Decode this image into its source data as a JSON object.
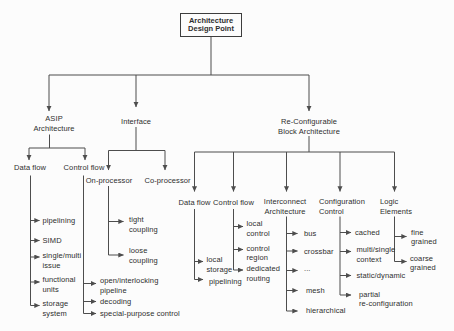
{
  "root": {
    "title": "Architecture\nDesign Point"
  },
  "nodes": {
    "asip": "ASIP\nArchitecture",
    "interface": "Interface",
    "reconfig": "Re-Configurable\nBlock Architecture",
    "asip_data_flow": "Data flow",
    "asip_control_flow": "Control flow",
    "on_processor": "On-processor",
    "co_processor": "Co-processor",
    "rc_data_flow": "Data flow",
    "rc_control_flow": "Control flow",
    "interconnect": "Interconnect\nArchitecture",
    "config_control": "Configuration\nControl",
    "logic_elements": "Logic\nElements"
  },
  "leaves": {
    "asip_data_flow": [
      "pipelining",
      "SIMD",
      "single/multi\nissue",
      "functional\nunits",
      "storage\nsystem"
    ],
    "asip_control_flow": [
      "open/interlocking\npipeline",
      "decoding",
      "special-purpose control"
    ],
    "on_processor": [
      "tight\ncoupling",
      "loose\ncoupling"
    ],
    "rc_data_flow": [
      "local\nstorage",
      "pipelining"
    ],
    "rc_control_flow": [
      "local\ncontrol",
      "control\nregion",
      "dedicated\nrouting"
    ],
    "interconnect": [
      "bus",
      "crossbar",
      "...",
      "mesh",
      "hierarchical"
    ],
    "config_control": [
      "cached",
      "multi/single\ncontext",
      "static/dynamic",
      "partial\nre-configuration"
    ],
    "logic_elements": [
      "fine\ngrained",
      "coarse\ngrained"
    ]
  },
  "colors": {
    "line": "#4d4d4d",
    "text": "#2e2e2e",
    "background": "#fcfcfc"
  }
}
